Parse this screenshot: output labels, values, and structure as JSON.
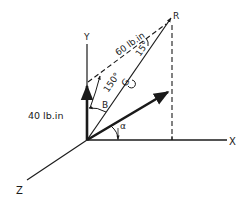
{
  "diagram": {
    "type": "3d-moment-vector-diagram",
    "axes": {
      "x_label": "X",
      "y_label": "Y",
      "z_label": "Z"
    },
    "vectors": {
      "moment_y": {
        "label": "40 lb.in"
      },
      "moment_inclined": {
        "label": "60 lb.in"
      },
      "resultant_point": {
        "label": "R"
      }
    },
    "angles": {
      "inclined_angle": "150°",
      "near_r_angle": "15°",
      "beta_label": "B",
      "alpha_label": "α"
    },
    "rotation_symbol": "G"
  },
  "colors": {
    "ink": "#1a1a1a",
    "background": "#ffffff"
  }
}
